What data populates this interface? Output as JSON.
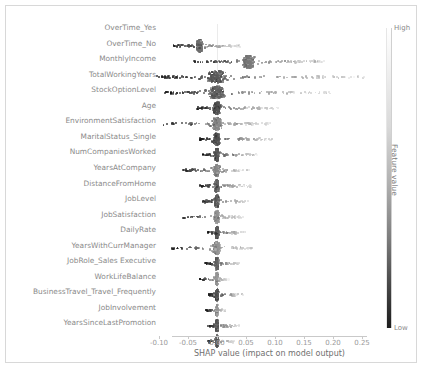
{
  "figure": {
    "background": "#ffffff",
    "frame_color": "#d8d8d8"
  },
  "colorbar": {
    "high_label": "High",
    "low_label": "Low",
    "title": "Feature value",
    "high_color": "#ffffff",
    "low_color": "#1c1c1c"
  },
  "caption": "",
  "chart_data": {
    "type": "scatter",
    "plot_kind": "shap-beeswarm-summary",
    "title": "",
    "xlabel": "SHAP value (impact on model output)",
    "ylabel": "",
    "xlim": [
      -0.115,
      0.275
    ],
    "xticks": [
      -0.1,
      -0.05,
      0.0,
      0.05,
      0.1,
      0.15,
      0.2,
      0.25
    ],
    "xticklabels": [
      "-0.10",
      "-0.05",
      "0.00",
      "0.05",
      "0.10",
      "0.15",
      "0.20",
      "0.25"
    ],
    "grid": false,
    "zero_gridline": true,
    "legend_position": "right-colorbar",
    "colormap": "grayscale (high=light, low=dark)",
    "features": [
      {
        "name": "OverTime_Yes",
        "xmin": -0.075,
        "xmax": 0.04,
        "dense_center": -0.03,
        "density": "very-high"
      },
      {
        "name": "OverTime_No",
        "xmin": -0.045,
        "xmax": 0.185,
        "dense_center": 0.055,
        "density": "high"
      },
      {
        "name": "MonthlyIncome",
        "xmin": -0.105,
        "xmax": 0.255,
        "dense_center": 0.0,
        "density": "high"
      },
      {
        "name": "TotalWorkingYears",
        "xmin": -0.09,
        "xmax": 0.2,
        "dense_center": 0.0,
        "density": "high"
      },
      {
        "name": "StockOptionLevel",
        "xmin": -0.035,
        "xmax": 0.105,
        "dense_center": 0.0,
        "density": "high"
      },
      {
        "name": "Age",
        "xmin": -0.1,
        "xmax": 0.095,
        "dense_center": 0.0,
        "density": "high"
      },
      {
        "name": "EnvironmentSatisfaction",
        "xmin": -0.03,
        "xmax": 0.095,
        "dense_center": 0.0,
        "density": "medium"
      },
      {
        "name": "MaritalStatus_Single",
        "xmin": -0.025,
        "xmax": 0.07,
        "dense_center": 0.0,
        "density": "medium"
      },
      {
        "name": "NumCompaniesWorked",
        "xmin": -0.06,
        "xmax": 0.055,
        "dense_center": 0.0,
        "density": "medium"
      },
      {
        "name": "YearsAtCompany",
        "xmin": -0.03,
        "xmax": 0.06,
        "dense_center": 0.0,
        "density": "medium"
      },
      {
        "name": "DistanceFromHome",
        "xmin": -0.025,
        "xmax": 0.055,
        "dense_center": 0.0,
        "density": "medium"
      },
      {
        "name": "JobLevel",
        "xmin": -0.06,
        "xmax": 0.045,
        "dense_center": 0.0,
        "density": "medium"
      },
      {
        "name": "JobSatisfaction",
        "xmin": -0.02,
        "xmax": 0.05,
        "dense_center": 0.0,
        "density": "medium"
      },
      {
        "name": "DailyRate",
        "xmin": -0.08,
        "xmax": 0.06,
        "dense_center": 0.0,
        "density": "medium"
      },
      {
        "name": "YearsWithCurrManager",
        "xmin": -0.02,
        "xmax": 0.04,
        "dense_center": 0.0,
        "density": "medium"
      },
      {
        "name": "JobRole_Sales Executive",
        "xmin": -0.03,
        "xmax": 0.02,
        "dense_center": 0.0,
        "density": "low"
      },
      {
        "name": "WorkLifeBalance",
        "xmin": -0.015,
        "xmax": 0.045,
        "dense_center": 0.0,
        "density": "low"
      },
      {
        "name": "BusinessTravel_Travel_Frequently",
        "xmin": -0.02,
        "xmax": 0.015,
        "dense_center": 0.0,
        "density": "low"
      },
      {
        "name": "JobInvolvement",
        "xmin": -0.015,
        "xmax": 0.04,
        "dense_center": 0.0,
        "density": "low"
      },
      {
        "name": "YearsSinceLastPromotion",
        "xmin": -0.015,
        "xmax": 0.03,
        "dense_center": 0.0,
        "density": "low"
      }
    ]
  }
}
